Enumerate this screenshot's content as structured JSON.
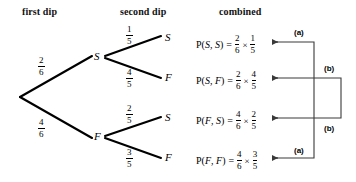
{
  "headings": {
    "first": "first dip",
    "second": "second dip",
    "combined": "combined"
  },
  "tree": {
    "root": {
      "x": 20,
      "y": 97
    },
    "level1": [
      {
        "id": "S",
        "label": "S",
        "x": 95,
        "y": 57,
        "prob_num": "2",
        "prob_den": "6"
      },
      {
        "id": "F",
        "label": "F",
        "x": 95,
        "y": 137,
        "prob_num": "4",
        "prob_den": "6"
      }
    ],
    "level2": [
      {
        "id": "SS",
        "label": "S",
        "x": 165,
        "y": 38,
        "prob_num": "1",
        "prob_den": "5"
      },
      {
        "id": "SF",
        "label": "F",
        "x": 165,
        "y": 78,
        "prob_num": "4",
        "prob_den": "5"
      },
      {
        "id": "FS",
        "label": "S",
        "x": 165,
        "y": 118,
        "prob_num": "2",
        "prob_den": "5"
      },
      {
        "id": "FF",
        "label": "F",
        "x": 165,
        "y": 158,
        "prob_num": "3",
        "prob_den": "5"
      }
    ]
  },
  "combined_rows": [
    {
      "id": "row-ss",
      "prefix": "P(",
      "arg1": "S",
      "sep": ", ",
      "arg2": "S",
      "suffix": ")",
      "equals": "=",
      "f1_num": "2",
      "f1_den": "6",
      "times": "×",
      "f2_num": "1",
      "f2_den": "5"
    },
    {
      "id": "row-sf",
      "prefix": "P(",
      "arg1": "S",
      "sep": ", ",
      "arg2": "F",
      "suffix": ")",
      "equals": "=",
      "f1_num": "2",
      "f1_den": "6",
      "times": "×",
      "f2_num": "4",
      "f2_den": "5"
    },
    {
      "id": "row-fs",
      "prefix": "P(",
      "arg1": "F",
      "sep": ", ",
      "arg2": "S",
      "suffix": ")",
      "equals": "=",
      "f1_num": "4",
      "f1_den": "6",
      "times": "×",
      "f2_num": "2",
      "f2_den": "5"
    },
    {
      "id": "row-ff",
      "prefix": "P(",
      "arg1": "F",
      "sep": ", ",
      "arg2": "F",
      "suffix": ")",
      "equals": "=",
      "f1_num": "4",
      "f1_den": "6",
      "times": "×",
      "f2_num": "3",
      "f2_den": "5"
    }
  ],
  "annotations": [
    {
      "id": "annot-a-top",
      "label": "(a)",
      "x": 294,
      "y": 28
    },
    {
      "id": "annot-b-top",
      "label": "(b)",
      "x": 324,
      "y": 64
    },
    {
      "id": "annot-b-bottom",
      "label": "(b)",
      "x": 324,
      "y": 124
    },
    {
      "id": "annot-a-bottom",
      "label": "(a)",
      "x": 294,
      "y": 146
    }
  ],
  "colors": {
    "ink": "#000000",
    "background": "#ffffff",
    "bracket": "#3a3a3a"
  }
}
